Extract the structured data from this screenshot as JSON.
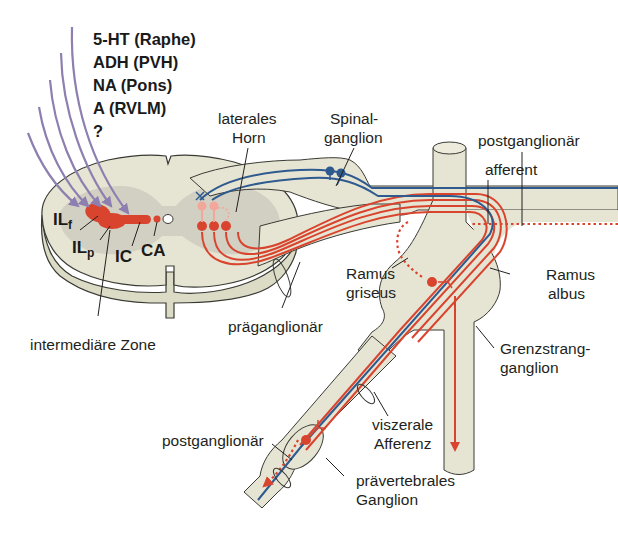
{
  "diagram": {
    "type": "sympathetic-nervous-system-anatomy",
    "colors": {
      "background": "#ffffff",
      "tissue": "#e6e5d3",
      "grey_matter": "#c9c8bb",
      "tissue_outline": "#3a3a35",
      "efferent_red": "#d9442f",
      "efferent_light": "#f3a79b",
      "afferent_blue": "#2e5a8f",
      "descending_purple": "#8d7fb0",
      "text": "#231f20"
    },
    "descending_inputs": {
      "labels": [
        "5-HT (Raphe)",
        "ADH (PVH)",
        "NA (Pons)",
        "A (RVLM)",
        "?"
      ]
    },
    "nuclei": {
      "ilf_main": "IL",
      "ilf_sub": "f",
      "ilp_main": "IL",
      "ilp_sub": "p",
      "ic": "IC",
      "ca": "CA"
    },
    "labels": {
      "intermediate_zone": "intermediäre Zone",
      "lateral_horn_1": "laterales",
      "lateral_horn_2": "Horn",
      "spinal_ganglion_1": "Spinal-",
      "spinal_ganglion_2": "ganglion",
      "postganglionic_top": "postganglionär",
      "afferent": "afferent",
      "ramus_griseus_1": "Ramus",
      "ramus_griseus_2": "griseus",
      "ramus_albus_1": "Ramus",
      "ramus_albus_2": "albus",
      "preganglionic": "präganglionär",
      "sympathetic_trunk_ganglion_1": "Grenzstrang-",
      "sympathetic_trunk_ganglion_2": "ganglion",
      "visceral_afferent_1": "viszerale",
      "visceral_afferent_2": "Afferenz",
      "postganglionic_bottom": "postganglionär",
      "prevertebral_ganglion_1": "prävertebrales",
      "prevertebral_ganglion_2": "Ganglion"
    }
  }
}
